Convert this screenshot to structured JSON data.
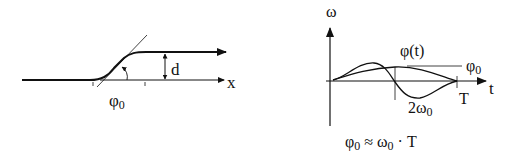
{
  "left_diagram": {
    "axis_label": "x",
    "offset_label": "d",
    "angle_label": "φ",
    "angle_subscript": "0"
  },
  "right_diagram": {
    "y_axis_label": "ω",
    "x_axis_label": "t",
    "end_time_label": "T",
    "curve_label": "φ(t)",
    "plateau_label": "φ",
    "plateau_subscript": "0",
    "peak_label": "2ω",
    "peak_subscript": "0",
    "formula": {
      "lhs": "φ",
      "lhs_sub": "0",
      "op": " ≈ ω",
      "mid_sub": "0",
      "rhs": " · T"
    }
  },
  "colors": {
    "stroke": "#111111",
    "background": "#ffffff"
  }
}
